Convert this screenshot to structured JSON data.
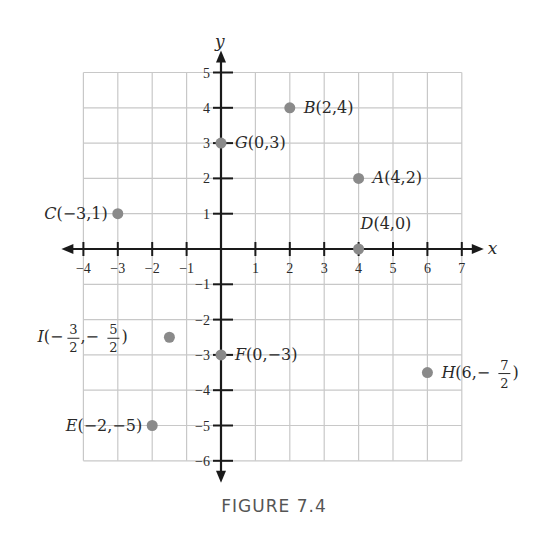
{
  "chart_data": {
    "type": "scatter",
    "title": "",
    "caption": "FIGURE 7.4",
    "xlabel": "x",
    "ylabel": "y",
    "xlim": [
      -4,
      7
    ],
    "ylim": [
      -6,
      5
    ],
    "grid": true,
    "legend": null,
    "x_ticks": [
      -4,
      -3,
      -2,
      -1,
      1,
      2,
      3,
      4,
      5,
      6,
      7
    ],
    "y_ticks": [
      5,
      4,
      3,
      2,
      1,
      -1,
      -2,
      -3,
      -4,
      -5,
      -6
    ],
    "points": [
      {
        "name": "A",
        "x": 4,
        "y": 2,
        "label": "A(4,2)"
      },
      {
        "name": "B",
        "x": 2,
        "y": 4,
        "label": "B(2,4)"
      },
      {
        "name": "C",
        "x": -3,
        "y": 1,
        "label": "C(−3,1)"
      },
      {
        "name": "D",
        "x": 4,
        "y": 0,
        "label": "D(4,0)"
      },
      {
        "name": "E",
        "x": -2,
        "y": -5,
        "label": "E(−2,−5)"
      },
      {
        "name": "F",
        "x": 0,
        "y": -3,
        "label": "F(0,−3)"
      },
      {
        "name": "G",
        "x": 0,
        "y": 3,
        "label": "G(0,3)"
      },
      {
        "name": "H",
        "x": 6,
        "y": -3.5,
        "label": "H(6,−7/2)"
      },
      {
        "name": "I",
        "x": -1.5,
        "y": -2.5,
        "label": "I(−3/2,−5/2)"
      }
    ]
  },
  "colors": {
    "point": "#8a8a8a",
    "grid": "#c8c8c8",
    "axis": "#1a1a1a",
    "caption": "#555555"
  },
  "figure": {
    "caption": "FIGURE 7.4"
  }
}
